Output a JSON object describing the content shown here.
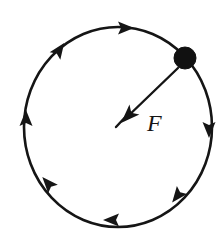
{
  "figure": {
    "background_color": "#ffffff",
    "ink_color": "#151515",
    "width": 224,
    "height": 241
  },
  "orbit": {
    "label": "circular path",
    "center_x": 118,
    "center_y": 127,
    "radius_x": 94,
    "radius_y": 100,
    "stroke_color": "#151515",
    "stroke_width": 2.6,
    "direction": "clockwise"
  },
  "direction_arrows": [
    {
      "name": "arrow-top",
      "x": 118,
      "y": 28,
      "angle_deg": 0,
      "points": "right"
    },
    {
      "name": "arrow-upper-left",
      "x": 55,
      "y": 56,
      "angle_deg": -55,
      "points": "up-right"
    },
    {
      "name": "arrow-left",
      "x": 26,
      "y": 126,
      "angle_deg": -90,
      "points": "up"
    },
    {
      "name": "arrow-lower-left",
      "x": 53,
      "y": 189,
      "angle_deg": -130,
      "points": "up-left"
    },
    {
      "name": "arrow-bottom",
      "x": 119,
      "y": 220,
      "angle_deg": 180,
      "points": "left"
    },
    {
      "name": "arrow-lower-right",
      "x": 182,
      "y": 190,
      "angle_deg": 130,
      "points": "down-left"
    },
    {
      "name": "arrow-right",
      "x": 209,
      "y": 122,
      "angle_deg": 90,
      "points": "down"
    }
  ],
  "particle": {
    "name": "ball",
    "x": 185,
    "y": 58,
    "radius": 11,
    "fill_color": "#111111"
  },
  "force_vector": {
    "label": "F",
    "label_x": 147,
    "label_y": 131,
    "description": "centripetal force directed from the ball toward the center",
    "tail_x": 178,
    "tail_y": 68,
    "tip_x": 122,
    "tip_y": 122,
    "stroke_color": "#151515",
    "stroke_width": 2.4
  }
}
